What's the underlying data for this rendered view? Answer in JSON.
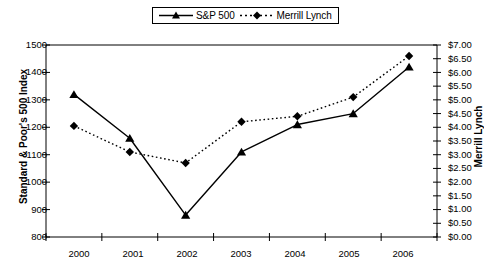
{
  "chart_data": {
    "type": "line",
    "title": "",
    "xlabel": "",
    "categories": [
      "2000",
      "2001",
      "2002",
      "2003",
      "2004",
      "2005",
      "2006"
    ],
    "grid": false,
    "legend_position": "top-center",
    "series": [
      {
        "name": "S&P 500",
        "axis": "left",
        "marker": "triangle",
        "linestyle": "solid",
        "color": "#000000",
        "values": [
          1320,
          1160,
          880,
          1110,
          1210,
          1250,
          1420
        ]
      },
      {
        "name": "Merrill Lynch",
        "axis": "right",
        "marker": "diamond",
        "linestyle": "dotted",
        "color": "#000000",
        "values": [
          4.05,
          3.1,
          2.7,
          4.2,
          4.4,
          5.1,
          6.6
        ]
      }
    ],
    "axes": {
      "left": {
        "label": "Standard & Poor's 500 Index",
        "min": 800,
        "max": 1500,
        "step": 100,
        "ticks": [
          "1500",
          "1400",
          "1300",
          "1200",
          "1100",
          "1000",
          "900",
          "800"
        ]
      },
      "right": {
        "label": "Merrill Lynch",
        "min": 0,
        "max": 7,
        "step": 0.5,
        "ticks": [
          "$7.00",
          "$6.50",
          "$6.00",
          "$5.50",
          "$5.00",
          "$4.50",
          "$4.00",
          "$3.50",
          "$3.00",
          "$2.50",
          "$2.00",
          "$1.50",
          "$1.00",
          "$0.50",
          "$0.00"
        ]
      }
    }
  },
  "legend": {
    "entries": [
      {
        "label": "S&P 500"
      },
      {
        "label": "Merrill Lynch"
      }
    ]
  }
}
